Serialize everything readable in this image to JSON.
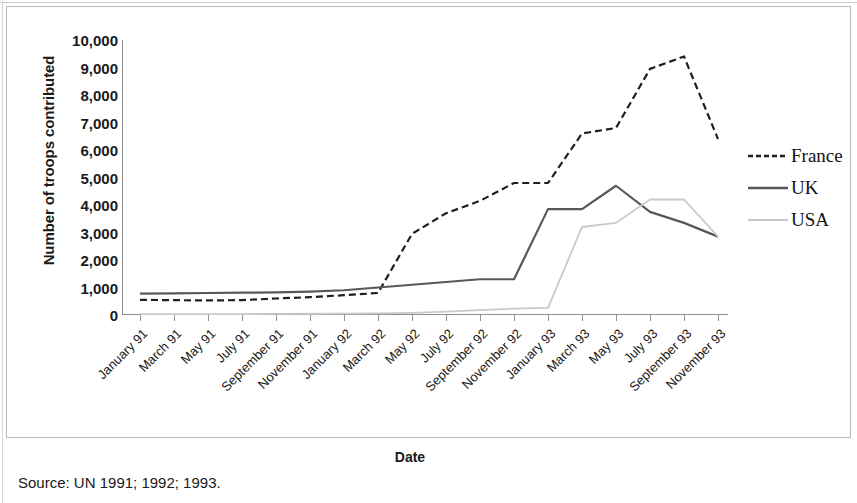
{
  "figure": {
    "y_axis_title": "Number of troops contributed",
    "x_axis_title": "Date",
    "source_note": "Source: UN 1991; 1992; 1993."
  },
  "legend": {
    "position": "right",
    "items": [
      {
        "label": "France",
        "style": "dashed",
        "color": "#1f1f1f"
      },
      {
        "label": "UK",
        "style": "solid",
        "color": "#58585a"
      },
      {
        "label": "USA",
        "style": "solid",
        "color": "#c9c9c9"
      }
    ]
  },
  "chart_data": {
    "type": "line",
    "title": "",
    "subtitle": "",
    "xlabel": "Date",
    "ylabel": "Number of troops contributed",
    "grid": false,
    "legend_position": "right",
    "ylim": [
      0,
      10000
    ],
    "ytick_labels": [
      "10,000",
      "9,000",
      "8,000",
      "7,000",
      "6,000",
      "5,000",
      "4,000",
      "3,000",
      "2,000",
      "1,000",
      "0"
    ],
    "ytick_values": [
      10000,
      9000,
      8000,
      7000,
      6000,
      5000,
      4000,
      3000,
      2000,
      1000,
      0
    ],
    "categories": [
      "January 91",
      "March 91",
      "May 91",
      "July 91",
      "September 91",
      "November 91",
      "January 92",
      "March 92",
      "May 92",
      "July 92",
      "September 92",
      "November 92",
      "January 93",
      "March 93",
      "May 93",
      "July 93",
      "September 93",
      "November 93"
    ],
    "series": [
      {
        "name": "France",
        "style": "dashed",
        "color": "#1f1f1f",
        "values": [
          550,
          540,
          530,
          540,
          600,
          650,
          720,
          800,
          2950,
          3700,
          4150,
          4800,
          4800,
          6600,
          6800,
          8950,
          9400,
          6400
        ]
      },
      {
        "name": "UK",
        "style": "solid",
        "color": "#58585a",
        "values": [
          780,
          790,
          800,
          810,
          820,
          850,
          900,
          1000,
          1100,
          1200,
          1300,
          1300,
          3850,
          3850,
          4700,
          3750,
          3350,
          2850
        ]
      },
      {
        "name": "USA",
        "style": "solid",
        "color": "#c9c9c9",
        "values": [
          30,
          30,
          30,
          35,
          40,
          45,
          50,
          60,
          80,
          120,
          180,
          230,
          260,
          3200,
          3350,
          4200,
          4200,
          2850
        ]
      }
    ],
    "annotations": []
  }
}
